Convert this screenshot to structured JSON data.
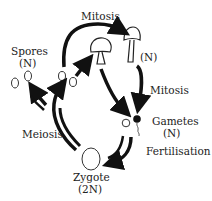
{
  "diagram": {
    "labels": {
      "mitosis_top": "Mitosis",
      "n_top": "(N)",
      "spores": "Spores",
      "spores_ploidy": "(N)",
      "mitosis_right": "Mitosis",
      "gametes": "Gametes",
      "gametes_ploidy": "(N)",
      "fertilisation": "Fertilisation",
      "meiosis": "Meiosis",
      "zygote": "Zygote",
      "zygote_ploidy": "(2N)"
    },
    "colors": {
      "stroke": "#111111",
      "text": "#222222",
      "background": "#ffffff"
    }
  }
}
